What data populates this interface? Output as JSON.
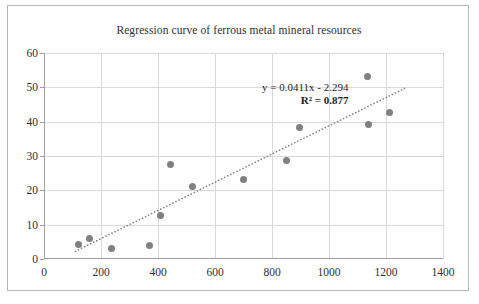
{
  "chart_data": {
    "type": "scatter",
    "title": "Regression curve of ferrous metal mineral resources",
    "xlabel": "",
    "ylabel": "",
    "xlim": [
      0,
      1400
    ],
    "ylim": [
      0,
      60
    ],
    "xticks": [
      0,
      200,
      400,
      600,
      800,
      1000,
      1200,
      1400
    ],
    "yticks": [
      0,
      10,
      20,
      30,
      40,
      50,
      60
    ],
    "grid": true,
    "legend": "none",
    "marker_color": "#808080",
    "trendline": {
      "type": "linear",
      "style": "dotted",
      "color": "#7f7f7f",
      "slope": 0.0411,
      "intercept": -2.294,
      "r_squared": 0.877,
      "equation_label": "y = 0.0411x - 2.294",
      "r2_label": "R² = 0.877",
      "x_start": 110,
      "x_end": 1270
    },
    "points": [
      {
        "x": 120,
        "y": 4.3
      },
      {
        "x": 160,
        "y": 6.0
      },
      {
        "x": 237,
        "y": 3.2
      },
      {
        "x": 370,
        "y": 4.0
      },
      {
        "x": 410,
        "y": 12.8
      },
      {
        "x": 443,
        "y": 27.5
      },
      {
        "x": 520,
        "y": 21.0
      },
      {
        "x": 700,
        "y": 23.2
      },
      {
        "x": 852,
        "y": 28.8
      },
      {
        "x": 895,
        "y": 38.3
      },
      {
        "x": 1135,
        "y": 53.3
      },
      {
        "x": 1140,
        "y": 39.2
      },
      {
        "x": 1212,
        "y": 42.8
      }
    ]
  }
}
